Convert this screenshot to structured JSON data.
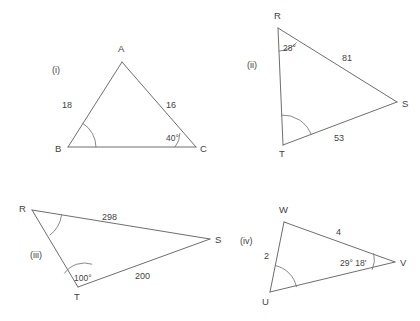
{
  "page": {
    "background": "#ffffff",
    "stroke_color": "#6e6e6e",
    "text_color": "#3f3f3f"
  },
  "figures": [
    {
      "id": "figure-i",
      "item_label": "(i)",
      "vertices": [
        {
          "name": "A",
          "label": "A"
        },
        {
          "name": "B",
          "label": "B"
        },
        {
          "name": "C",
          "label": "C"
        }
      ],
      "sides": [
        {
          "name": "AB",
          "label": "18"
        },
        {
          "name": "AC",
          "label": "16"
        }
      ],
      "angles": [
        {
          "at": "B",
          "label": "",
          "marked": true
        },
        {
          "at": "C",
          "label": "40°",
          "marked": false
        }
      ]
    },
    {
      "id": "figure-ii",
      "item_label": "(ii)",
      "vertices": [
        {
          "name": "R",
          "label": "R"
        },
        {
          "name": "S",
          "label": "S"
        },
        {
          "name": "T",
          "label": "T"
        }
      ],
      "sides": [
        {
          "name": "RS",
          "label": "81"
        },
        {
          "name": "TS",
          "label": "53"
        }
      ],
      "angles": [
        {
          "at": "R",
          "label": "28°",
          "marked": false
        },
        {
          "at": "T",
          "label": "",
          "marked": true
        }
      ]
    },
    {
      "id": "figure-iii",
      "item_label": "(iii)",
      "vertices": [
        {
          "name": "R",
          "label": "R"
        },
        {
          "name": "S",
          "label": "S"
        },
        {
          "name": "T",
          "label": "T"
        }
      ],
      "sides": [
        {
          "name": "RS",
          "label": "298"
        },
        {
          "name": "TS",
          "label": "200"
        }
      ],
      "angles": [
        {
          "at": "R",
          "label": "",
          "marked": true
        },
        {
          "at": "T",
          "label": "100°",
          "marked": false
        }
      ]
    },
    {
      "id": "figure-iv",
      "item_label": "(iv)",
      "vertices": [
        {
          "name": "W",
          "label": "W"
        },
        {
          "name": "U",
          "label": "U"
        },
        {
          "name": "V",
          "label": "V"
        }
      ],
      "sides": [
        {
          "name": "WV",
          "label": "4"
        },
        {
          "name": "WU",
          "label": "2"
        }
      ],
      "angles": [
        {
          "at": "U",
          "label": "",
          "marked": true
        },
        {
          "at": "V",
          "label": "29° 18'",
          "marked": false
        }
      ]
    }
  ]
}
